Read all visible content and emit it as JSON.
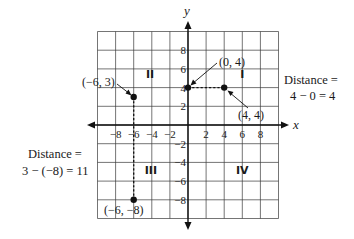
{
  "diagram": {
    "type": "coordinate-plane",
    "x_range": [
      -10,
      10
    ],
    "y_range": [
      -10,
      10
    ],
    "grid_step": 2,
    "axis_labels": {
      "x": "x",
      "y": "y"
    },
    "x_ticks": [
      {
        "value": -8,
        "label": "−8"
      },
      {
        "value": -6,
        "label": "−6"
      },
      {
        "value": -4,
        "label": "−4"
      },
      {
        "value": -2,
        "label": "−2"
      },
      {
        "value": 2,
        "label": "2"
      },
      {
        "value": 4,
        "label": "4"
      },
      {
        "value": 6,
        "label": "6"
      },
      {
        "value": 8,
        "label": "8"
      }
    ],
    "y_ticks": [
      {
        "value": 8,
        "label": "8"
      },
      {
        "value": 6,
        "label": "6"
      },
      {
        "value": 4,
        "label": "4"
      },
      {
        "value": 2,
        "label": "2"
      },
      {
        "value": -2,
        "label": "−2"
      },
      {
        "value": -4,
        "label": "−4"
      },
      {
        "value": -6,
        "label": "−6"
      },
      {
        "value": -8,
        "label": "−8"
      }
    ],
    "quadrants": [
      {
        "label": "I",
        "x": 6,
        "y": 5.5
      },
      {
        "label": "II",
        "x": -4.2,
        "y": 5.5
      },
      {
        "label": "III",
        "x": -4.1,
        "y": -4.8
      },
      {
        "label": "IV",
        "x": 6,
        "y": -4.8
      }
    ],
    "points": [
      {
        "name": "point-neg6-3",
        "x": -6,
        "y": 3,
        "label": "(−6, 3)"
      },
      {
        "name": "point-0-4",
        "x": 0,
        "y": 4,
        "label": "(0, 4)"
      },
      {
        "name": "point-4-4",
        "x": 4,
        "y": 4,
        "label": "(4, 4)"
      },
      {
        "name": "point-neg6-neg8",
        "x": -6,
        "y": -8,
        "label": "(−6, −8)"
      }
    ],
    "segments": [
      {
        "from": [
          0,
          4
        ],
        "to": [
          4,
          4
        ],
        "style": "dashed"
      },
      {
        "from": [
          -6,
          3
        ],
        "to": [
          -6,
          -8
        ],
        "style": "dashed"
      }
    ],
    "annotations": {
      "horizontal_distance": {
        "line1": "Distance =",
        "line2": "4 − 0 = 4"
      },
      "vertical_distance": {
        "line1": "Distance =",
        "line2": "3 − (−8) = 11"
      }
    }
  }
}
